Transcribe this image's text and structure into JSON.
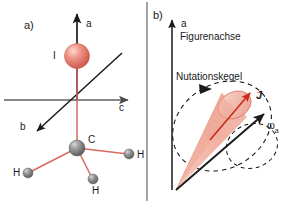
{
  "figure": {
    "width": 287,
    "height": 203,
    "background": "#ffffff",
    "divider_color": "#555555"
  },
  "panel_a": {
    "tag": "a)",
    "description": "Methyl iodide molecule with inertial principal axes",
    "axes": [
      {
        "name": "a-axis",
        "label": "a",
        "direction": "up",
        "color": "#1a1a1a"
      },
      {
        "name": "b-axis",
        "label": "b",
        "direction": "down-left",
        "color": "#1a1a1a"
      },
      {
        "name": "c-axis",
        "label": "c",
        "direction": "right",
        "color": "#555555"
      }
    ],
    "atoms": [
      {
        "name": "iodine",
        "label": "I",
        "color": "#e8796b"
      },
      {
        "name": "carbon",
        "label": "C",
        "color": "#8c8c8c"
      },
      {
        "name": "hydrogen-left",
        "label": "H",
        "color": "#8c8c8c"
      },
      {
        "name": "hydrogen-right",
        "label": "H",
        "color": "#8c8c8c"
      },
      {
        "name": "hydrogen-front",
        "label": "H",
        "color": "#8c8c8c"
      }
    ],
    "bond_color": "#d9695e"
  },
  "panel_b": {
    "tag": "b)",
    "description": "Nutation cone of the angular velocity about the figure axis",
    "axis_label": "a",
    "figure_axis_label": "Figurenachse",
    "cone_label": "Nutationskegel",
    "angular_momentum_label": "J",
    "angular_velocity_label": "ω",
    "angular_velocity_subscript": "a",
    "cone_fill": "#f2b6a8",
    "cone_stroke": "#d9695e",
    "vector_color": "#cc2a19",
    "dashed_color": "#1a1a1a",
    "axis_color": "#1a1a1a"
  }
}
